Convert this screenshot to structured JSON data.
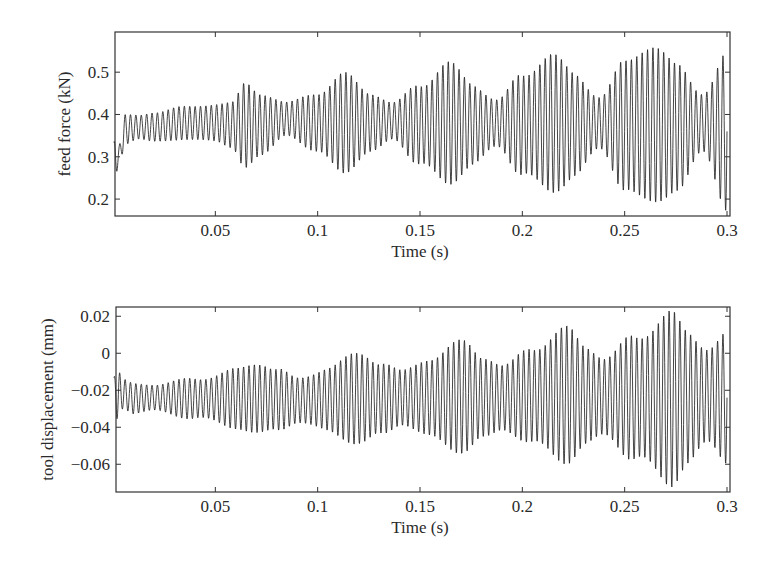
{
  "chart_data": [
    {
      "type": "line",
      "title": "",
      "xlabel": "Time (s)",
      "ylabel": "feed force (kN)",
      "xlim": [
        0,
        0.3
      ],
      "ylim": [
        0.16,
        0.595
      ],
      "grid": false,
      "legend": null,
      "xticks": [
        0.05,
        0.1,
        0.15,
        0.2,
        0.25,
        0.3
      ],
      "xtick_labels": [
        "0.05",
        "0.1",
        "0.15",
        "0.2",
        "0.25",
        "0.3"
      ],
      "yticks": [
        0.2,
        0.3,
        0.4,
        0.5
      ],
      "ytick_labels": [
        "0.2",
        "0.3",
        "0.4",
        "0.5"
      ],
      "oscillation_frequency_hz": 380,
      "description": "Dense oscillating feed-force signal with periodically growing beat envelope (peaks ~every 0.05 s)",
      "envelope": {
        "t": [
          0.0005,
          0.003,
          0.006,
          0.012,
          0.02,
          0.035,
          0.05,
          0.058,
          0.065,
          0.072,
          0.085,
          0.1,
          0.113,
          0.126,
          0.137,
          0.15,
          0.163,
          0.176,
          0.188,
          0.2,
          0.213,
          0.226,
          0.238,
          0.25,
          0.263,
          0.276,
          0.288,
          0.3
        ],
        "max": [
          0.34,
          0.33,
          0.4,
          0.4,
          0.41,
          0.42,
          0.43,
          0.43,
          0.48,
          0.46,
          0.43,
          0.46,
          0.5,
          0.46,
          0.43,
          0.48,
          0.53,
          0.48,
          0.44,
          0.5,
          0.56,
          0.5,
          0.45,
          0.53,
          0.59,
          0.52,
          0.46,
          0.55
        ],
        "min": [
          0.24,
          0.28,
          0.33,
          0.34,
          0.33,
          0.34,
          0.33,
          0.32,
          0.27,
          0.29,
          0.35,
          0.3,
          0.26,
          0.3,
          0.34,
          0.27,
          0.23,
          0.27,
          0.32,
          0.25,
          0.2,
          0.25,
          0.31,
          0.22,
          0.16,
          0.22,
          0.3,
          0.17
        ]
      },
      "envelope_peaks": [
        {
          "t": 0.065,
          "max": 0.48,
          "min": 0.27
        },
        {
          "t": 0.113,
          "max": 0.5,
          "min": 0.26
        },
        {
          "t": 0.163,
          "max": 0.53,
          "min": 0.23
        },
        {
          "t": 0.213,
          "max": 0.56,
          "min": 0.2
        },
        {
          "t": 0.263,
          "max": 0.59,
          "min": 0.16
        }
      ]
    },
    {
      "type": "line",
      "title": "",
      "xlabel": "Time (s)",
      "ylabel": "tool displacement (mm)",
      "xlim": [
        0,
        0.3
      ],
      "ylim": [
        -0.075,
        0.025
      ],
      "grid": false,
      "legend": null,
      "xticks": [
        0.05,
        0.1,
        0.15,
        0.2,
        0.25,
        0.3
      ],
      "xtick_labels": [
        "0.05",
        "0.1",
        "0.15",
        "0.2",
        "0.25",
        "0.3"
      ],
      "yticks": [
        -0.06,
        -0.04,
        -0.02,
        0,
        0.02
      ],
      "ytick_labels": [
        "−0.06",
        "−0.04",
        "−0.02",
        "0",
        "0.02"
      ],
      "oscillation_frequency_hz": 380,
      "description": "Dense oscillating tool-displacement signal with growing beat envelope (peaks ~every 0.05 s)",
      "envelope": {
        "t": [
          0.0005,
          0.002,
          0.005,
          0.01,
          0.02,
          0.04,
          0.06,
          0.072,
          0.08,
          0.09,
          0.105,
          0.122,
          0.131,
          0.141,
          0.155,
          0.172,
          0.181,
          0.191,
          0.205,
          0.222,
          0.231,
          0.241,
          0.255,
          0.272,
          0.281,
          0.291,
          0.3
        ],
        "max": [
          -0.012,
          -0.008,
          -0.014,
          -0.016,
          -0.016,
          -0.013,
          -0.008,
          -0.003,
          -0.007,
          -0.013,
          -0.006,
          0.002,
          -0.003,
          -0.009,
          0.0,
          0.008,
          0.001,
          -0.006,
          0.006,
          0.015,
          0.007,
          -0.001,
          0.012,
          0.024,
          0.014,
          0.006,
          0.012
        ],
        "min": [
          -0.03,
          -0.036,
          -0.03,
          -0.033,
          -0.032,
          -0.036,
          -0.041,
          -0.046,
          -0.043,
          -0.038,
          -0.044,
          -0.051,
          -0.046,
          -0.039,
          -0.048,
          -0.055,
          -0.049,
          -0.042,
          -0.052,
          -0.06,
          -0.053,
          -0.046,
          -0.06,
          -0.073,
          -0.062,
          -0.052,
          -0.06
        ]
      },
      "envelope_peaks": [
        {
          "t": 0.072,
          "max": -0.003,
          "min": -0.046
        },
        {
          "t": 0.122,
          "max": 0.002,
          "min": -0.051
        },
        {
          "t": 0.172,
          "max": 0.008,
          "min": -0.055
        },
        {
          "t": 0.222,
          "max": 0.015,
          "min": -0.06
        },
        {
          "t": 0.272,
          "max": 0.024,
          "min": -0.073
        }
      ]
    }
  ],
  "plots": [
    {
      "id": "feed-force",
      "box": {
        "left": 115,
        "top": 32,
        "right": 730,
        "bottom": 216
      },
      "x0_px": 113,
      "xlabel": "Time (s)",
      "ylabel": "feed force (kN)"
    },
    {
      "id": "tool-displacement",
      "box": {
        "left": 116,
        "top": 307,
        "right": 730,
        "bottom": 492
      },
      "x0_px": 113,
      "xlabel": "Time (s)",
      "ylabel": "tool displacement (mm)"
    }
  ],
  "colors": {
    "line": "#1a1a1a",
    "axis": "#333333",
    "background": "#ffffff"
  }
}
